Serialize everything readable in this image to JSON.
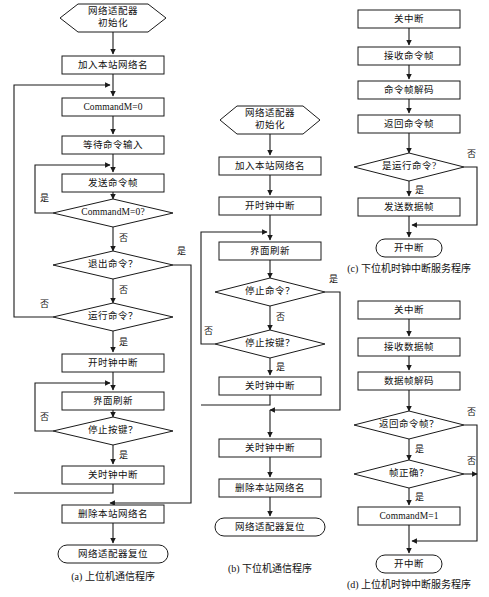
{
  "figure": {
    "background_color": "#ffffff",
    "line_color": "#1a1a1a",
    "text_color": "#111111",
    "shape_fill": "#ffffff"
  },
  "panels": [
    {
      "id": "a",
      "caption": "(a) 上位机通信程序",
      "nodes": [
        {
          "key": "a_start",
          "type": "hexagon",
          "label": "网络适配器\n初始化"
        },
        {
          "key": "a_join",
          "type": "process",
          "label": "加入本站网络名"
        },
        {
          "key": "a_cmd0",
          "type": "process",
          "label": "CommandM=0"
        },
        {
          "key": "a_wait",
          "type": "process",
          "label": "等待命令输入"
        },
        {
          "key": "a_send",
          "type": "process",
          "label": "发送命令帧"
        },
        {
          "key": "a_chk0",
          "type": "decision",
          "label": "CommandM=0?"
        },
        {
          "key": "a_quit",
          "type": "decision",
          "label": "退出命令？"
        },
        {
          "key": "a_run",
          "type": "decision",
          "label": "运行命令？"
        },
        {
          "key": "a_tmron",
          "type": "process",
          "label": "开时钟中断"
        },
        {
          "key": "a_refresh",
          "type": "process",
          "label": "界面刷新"
        },
        {
          "key": "a_stopkey",
          "type": "decision",
          "label": "停止按键？"
        },
        {
          "key": "a_tmroff",
          "type": "process",
          "label": "关时钟中断"
        },
        {
          "key": "a_del",
          "type": "process",
          "label": "删除本站网络名"
        },
        {
          "key": "a_reset",
          "type": "terminal",
          "label": "网络适配器复位"
        }
      ],
      "edge_labels": [
        {
          "key": "a_e1",
          "label": "是"
        },
        {
          "key": "a_e2",
          "label": "否"
        },
        {
          "key": "a_e3",
          "label": "是"
        },
        {
          "key": "a_e4",
          "label": "否"
        },
        {
          "key": "a_e5",
          "label": "否"
        },
        {
          "key": "a_e6",
          "label": "是"
        },
        {
          "key": "a_e7",
          "label": "否"
        },
        {
          "key": "a_e8",
          "label": "是"
        }
      ]
    },
    {
      "id": "b",
      "caption": "(b) 下位机通信程序",
      "nodes": [
        {
          "key": "b_start",
          "type": "hexagon",
          "label": "网络适配器\n初始化"
        },
        {
          "key": "b_join",
          "type": "process",
          "label": "加入本站网络名"
        },
        {
          "key": "b_tmron",
          "type": "process",
          "label": "开时钟中断"
        },
        {
          "key": "b_refresh",
          "type": "process",
          "label": "界面刷新"
        },
        {
          "key": "b_stopcmd",
          "type": "decision",
          "label": "停止命令？"
        },
        {
          "key": "b_stopkey",
          "type": "decision",
          "label": "停止按键？"
        },
        {
          "key": "b_tmroff1",
          "type": "process",
          "label": "关时钟中断"
        },
        {
          "key": "b_tmroff2",
          "type": "process",
          "label": "关时钟中断"
        },
        {
          "key": "b_del",
          "type": "process",
          "label": "删除本站网络名"
        },
        {
          "key": "b_reset",
          "type": "terminal",
          "label": "网络适配器复位"
        }
      ],
      "edge_labels": [
        {
          "key": "b_e1",
          "label": "是"
        },
        {
          "key": "b_e2",
          "label": "否"
        },
        {
          "key": "b_e3",
          "label": "否"
        },
        {
          "key": "b_e4",
          "label": "是"
        }
      ]
    },
    {
      "id": "c",
      "caption": "(c) 下位机时钟中断服务程序",
      "nodes": [
        {
          "key": "c_iroff",
          "type": "process",
          "label": "关中断"
        },
        {
          "key": "c_recv",
          "type": "process",
          "label": "接收命令帧"
        },
        {
          "key": "c_decode",
          "type": "process",
          "label": "命令帧解码"
        },
        {
          "key": "c_back",
          "type": "process",
          "label": "返回命令帧"
        },
        {
          "key": "c_isrun",
          "type": "decision",
          "label": "是运行命令?"
        },
        {
          "key": "c_senddt",
          "type": "process",
          "label": "发送数据帧"
        },
        {
          "key": "c_iron",
          "type": "terminal",
          "label": "开中断"
        }
      ],
      "edge_labels": [
        {
          "key": "c_e1",
          "label": "否"
        },
        {
          "key": "c_e2",
          "label": "是"
        }
      ]
    },
    {
      "id": "d",
      "caption": "(d) 上位机时钟中断服务程序",
      "nodes": [
        {
          "key": "d_iroff",
          "type": "process",
          "label": "关中断"
        },
        {
          "key": "d_recv",
          "type": "process",
          "label": "接收数据帧"
        },
        {
          "key": "d_decode",
          "type": "process",
          "label": "数据帧解码"
        },
        {
          "key": "d_isback",
          "type": "decision",
          "label": "返回命令帧？"
        },
        {
          "key": "d_isok",
          "type": "decision",
          "label": "帧正确？"
        },
        {
          "key": "d_cmd1",
          "type": "process",
          "label": "CommandM=1"
        },
        {
          "key": "d_iron",
          "type": "terminal",
          "label": "开中断"
        }
      ],
      "edge_labels": [
        {
          "key": "d_e1",
          "label": "否"
        },
        {
          "key": "d_e2",
          "label": "是"
        },
        {
          "key": "d_e3",
          "label": "否"
        },
        {
          "key": "d_e4",
          "label": "是"
        }
      ]
    }
  ]
}
